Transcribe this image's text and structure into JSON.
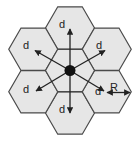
{
  "diagram": {
    "title": "",
    "colors": {
      "cell_fill": "#e6e6e6",
      "cell_stroke": "#4a4a4a",
      "arrow": "#222222",
      "center_node": "#111111",
      "background": "#ffffff"
    },
    "cells": [
      {
        "id": "center"
      },
      {
        "id": "top"
      },
      {
        "id": "bottom"
      },
      {
        "id": "upper-left"
      },
      {
        "id": "upper-right"
      },
      {
        "id": "lower-left"
      },
      {
        "id": "lower-right"
      }
    ],
    "labels": {
      "top": "d",
      "bottom": "d",
      "upper_left": "d",
      "upper_right": "d",
      "lower_left": "d",
      "lower_right": "d",
      "radius": "R"
    }
  }
}
